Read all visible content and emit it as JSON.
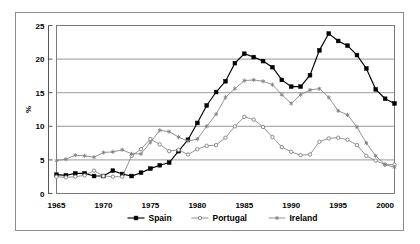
{
  "chart_data": {
    "type": "line",
    "title": "",
    "subtitle": "",
    "xlabel": "",
    "ylabel": "%",
    "xlim": [
      1965,
      2001
    ],
    "ylim": [
      0,
      25
    ],
    "xticks": [
      "1965",
      "1970",
      "1975",
      "1980",
      "1985",
      "1990",
      "1995",
      "2000"
    ],
    "xtick_values": [
      1965,
      1970,
      1975,
      1980,
      1985,
      1990,
      1995,
      2000
    ],
    "yticks": [
      "0",
      "5",
      "10",
      "15",
      "20",
      "25"
    ],
    "ytick_values": [
      0,
      5,
      10,
      15,
      20,
      25
    ],
    "grid": "horizontal",
    "legend_position": "bottom-center",
    "x": [
      1965,
      1966,
      1967,
      1968,
      1969,
      1970,
      1971,
      1972,
      1973,
      1974,
      1975,
      1976,
      1977,
      1978,
      1979,
      1980,
      1981,
      1982,
      1983,
      1984,
      1985,
      1986,
      1987,
      1988,
      1989,
      1990,
      1991,
      1992,
      1993,
      1994,
      1995,
      1996,
      1997,
      1998,
      1999,
      2000,
      2001
    ],
    "series": [
      {
        "name": "Spain",
        "marker": "filled-square",
        "color": "#000000",
        "values": [
          2.8,
          2.7,
          3.0,
          3.0,
          2.6,
          2.6,
          3.4,
          2.9,
          2.6,
          3.1,
          3.7,
          4.2,
          4.6,
          6.3,
          8.0,
          10.5,
          13.1,
          15.1,
          16.7,
          19.4,
          20.8,
          20.3,
          19.7,
          18.8,
          16.9,
          15.9,
          15.9,
          17.6,
          21.3,
          23.8,
          22.7,
          22.0,
          20.6,
          18.6,
          15.5,
          14.1,
          13.4
        ]
      },
      {
        "name": "Portugal",
        "marker": "open-circle",
        "color": "#808080",
        "values": [
          2.5,
          2.4,
          2.5,
          2.7,
          3.4,
          2.6,
          2.5,
          2.5,
          5.6,
          6.6,
          8.1,
          7.3,
          6.3,
          6.5,
          5.8,
          6.6,
          7.1,
          7.2,
          8.3,
          10.0,
          11.4,
          11.0,
          9.9,
          8.4,
          6.9,
          6.2,
          5.7,
          5.8,
          7.7,
          8.2,
          8.3,
          8.0,
          7.2,
          5.6,
          4.9,
          4.3,
          4.3
        ]
      },
      {
        "name": "Ireland",
        "marker": "asterisk",
        "color": "#808080",
        "values": [
          4.9,
          5.1,
          5.7,
          5.6,
          5.4,
          6.1,
          6.2,
          6.5,
          5.9,
          5.9,
          7.6,
          9.4,
          9.2,
          8.4,
          7.8,
          8.1,
          10.0,
          11.8,
          14.3,
          15.6,
          16.8,
          16.9,
          16.7,
          16.2,
          14.7,
          13.4,
          14.7,
          15.4,
          15.6,
          14.3,
          12.3,
          11.7,
          9.9,
          7.5,
          5.6,
          4.3,
          3.9
        ]
      }
    ]
  },
  "legend": {
    "items": [
      {
        "label": "Spain"
      },
      {
        "label": "Portugal"
      },
      {
        "label": "Ireland"
      }
    ]
  }
}
